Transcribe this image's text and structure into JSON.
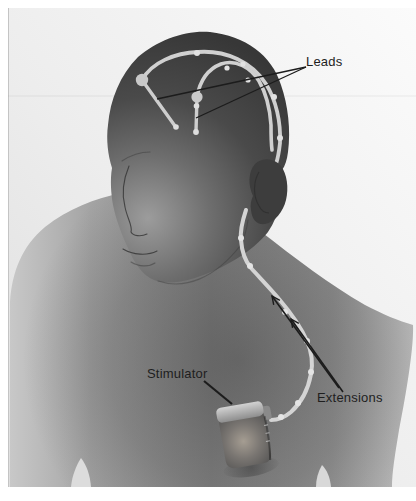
{
  "illustration": {
    "labels": {
      "leads": "Leads",
      "stimulator": "Stimulator",
      "extensions": "Extensions"
    },
    "components": {
      "lead_count": 2,
      "extension_arrow_count": 2
    },
    "colors": {
      "page_background": "#ffffff",
      "panel_background": "#efefef",
      "head_dark": "#3a3a3a",
      "torso_mid": "#8c8c8c",
      "cable_light": "#d2d2d2",
      "annotation_line": "#1c1c1c",
      "label_text": "#1e1e1e"
    }
  }
}
